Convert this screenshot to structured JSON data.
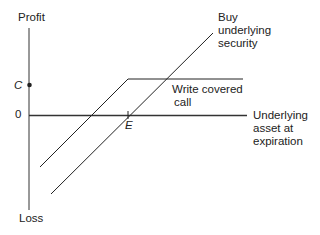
{
  "axes": {
    "y_top_label": "Profit",
    "y_bottom_label": "Loss",
    "zero_label": "0",
    "x_label_lines": [
      "Underlying",
      "asset at",
      "expiration"
    ]
  },
  "markers": {
    "c_label": "C",
    "e_label": "E"
  },
  "series": {
    "buy_label_lines": [
      "Buy",
      "underlying",
      "security"
    ],
    "covered_call_label_lines": [
      "Write covered",
      "call"
    ]
  },
  "colors": {
    "line": "#222222",
    "axis": "#333333"
  }
}
